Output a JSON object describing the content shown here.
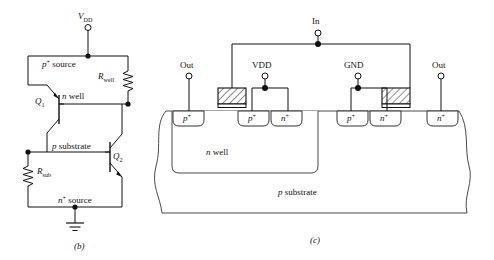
{
  "figure": {
    "panel_b": {
      "caption": "(b)",
      "title_hidden": "",
      "terminals": [
        {
          "name": "vdd",
          "label_v": "V",
          "label_sub": "DD",
          "x": 88,
          "y": 24
        },
        {
          "name": "ground",
          "label": "",
          "x": 88,
          "y": 232
        }
      ],
      "nodes": [
        {
          "name": "p-plus-source",
          "text_main": "p",
          "text_sup": "+",
          "text_rest": " source"
        },
        {
          "name": "n-well",
          "text_main": "n",
          "text_rest": " well"
        },
        {
          "name": "p-substrate",
          "text_main": "p",
          "text_rest": " substrate"
        },
        {
          "name": "n-plus-source",
          "text_main": "n",
          "text_sup": "+",
          "text_rest": " source"
        }
      ],
      "resistors": [
        {
          "name": "r-well",
          "label_main": "R",
          "label_sub": "well"
        },
        {
          "name": "r-sub",
          "label_main": "R",
          "label_sub": "sub"
        }
      ],
      "transistors": [
        {
          "name": "q1",
          "label_main": "Q",
          "label_sub": "1",
          "type": "pnp"
        },
        {
          "name": "q2",
          "label_main": "Q",
          "label_sub": "2",
          "type": "npn"
        }
      ]
    },
    "panel_c": {
      "caption": "(c)",
      "terminals": [
        {
          "name": "out-left",
          "label": "Out",
          "x": 206,
          "y": 76
        },
        {
          "name": "vdd",
          "label": "VDD",
          "x": 265,
          "y": 76
        },
        {
          "name": "in",
          "label": "In",
          "x": 318,
          "y": 33
        },
        {
          "name": "gnd",
          "label": "GND",
          "x": 358,
          "y": 76
        },
        {
          "name": "out-right",
          "label": "Out",
          "x": 423,
          "y": 76
        }
      ],
      "regions": [
        {
          "name": "n-well-region",
          "text_main": "n",
          "text_rest": " well"
        },
        {
          "name": "p-substrate-region",
          "text_main": "p",
          "text_rest": " substrate"
        }
      ],
      "diffusions": [
        {
          "name": "diff-1",
          "text_main": "p",
          "text_sup": "+",
          "x": 186,
          "y": 116
        },
        {
          "name": "diff-2",
          "text_main": "p",
          "text_sup": "+",
          "x": 251,
          "y": 116
        },
        {
          "name": "diff-3",
          "text_main": "n",
          "text_sup": "+",
          "x": 284,
          "y": 116
        },
        {
          "name": "diff-4",
          "text_main": "p",
          "text_sup": "+",
          "x": 350,
          "y": 116
        },
        {
          "name": "diff-5",
          "text_main": "n",
          "text_sup": "+",
          "x": 383,
          "y": 116
        },
        {
          "name": "diff-6",
          "text_main": "n",
          "text_sup": "+",
          "x": 440,
          "y": 116
        }
      ],
      "gates": [
        {
          "name": "gate-pmos",
          "x": 218,
          "y": 88,
          "w": 28,
          "h": 16
        },
        {
          "name": "gate-nmos",
          "x": 382,
          "y": 88,
          "w": 28,
          "h": 16
        }
      ]
    }
  },
  "colors": {
    "ink": "#111111",
    "background": "#ffffff",
    "hatch": "#333333"
  }
}
